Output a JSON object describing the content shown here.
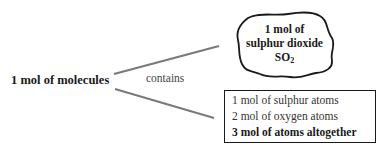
{
  "diagram": {
    "root": {
      "label": "1 mol of molecules"
    },
    "edge": {
      "label": "contains"
    },
    "cloud": {
      "lines": [
        "1 mol of",
        "sulphur dioxide"
      ],
      "formula": {
        "base": "SO",
        "subscript": "2"
      }
    },
    "box": {
      "lines": [
        {
          "text": "1 mol of sulphur atoms",
          "bold": false
        },
        {
          "text": "2 mol of oxygen atoms",
          "bold": false
        },
        {
          "text": "3 mol of atoms altogether",
          "bold": true
        }
      ]
    },
    "colors": {
      "line": "#777777",
      "border": "#1a1a1a",
      "text": "#1a1a1a"
    }
  }
}
